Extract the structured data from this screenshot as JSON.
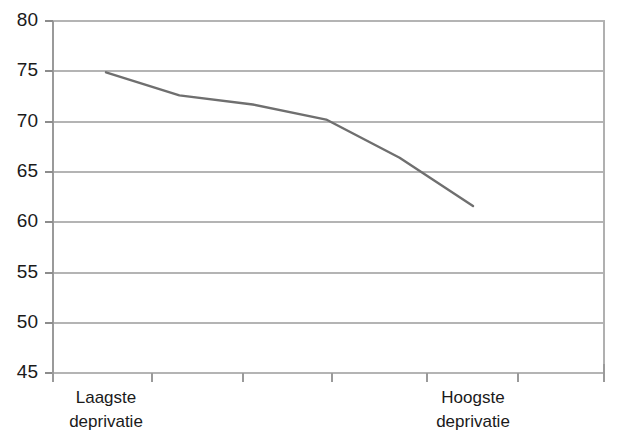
{
  "chart_data": {
    "type": "line",
    "title": "",
    "subtitle": "",
    "xlabel": "",
    "ylabel": "",
    "x": [
      1,
      2,
      3,
      4,
      5,
      6
    ],
    "categories": [
      "Laagste deprivatie",
      "",
      "",
      "",
      "",
      "Hoogste deprivatie"
    ],
    "series": [
      {
        "name": "",
        "values": [
          74.9,
          72.6,
          71.7,
          70.2,
          66.4,
          61.6
        ],
        "color": "#6f6f6f"
      }
    ],
    "ylim": [
      45,
      80
    ],
    "yticks": [
      80,
      75,
      70,
      65,
      60,
      55,
      50,
      45
    ],
    "ytick_labels": [
      "80",
      "75",
      "70",
      "65",
      "60",
      "55",
      "50",
      "45"
    ],
    "xtick_count": 7,
    "xtick_labels": [
      "Laagste deprivatie",
      "Hoogste deprivatie"
    ],
    "grid": true,
    "grid_axis": "y",
    "grid_color": "#b4b4b4",
    "legend": false,
    "legend_position": "none",
    "background_color": "#ffffff",
    "axis_color": "#9a9a9a",
    "annotations": []
  },
  "axes": {
    "y": {
      "ticks": [
        {
          "label": "80",
          "value": 80
        },
        {
          "label": "75",
          "value": 75
        },
        {
          "label": "70",
          "value": 70
        },
        {
          "label": "65",
          "value": 65
        },
        {
          "label": "60",
          "value": 60
        },
        {
          "label": "55",
          "value": 55
        },
        {
          "label": "50",
          "value": 50
        },
        {
          "label": "45",
          "value": 45
        }
      ]
    },
    "x": {
      "labels": [
        {
          "line1": "Laagste",
          "line2": "deprivatie"
        },
        {
          "line1": "Hoogste",
          "line2": "deprivatie"
        }
      ]
    }
  }
}
